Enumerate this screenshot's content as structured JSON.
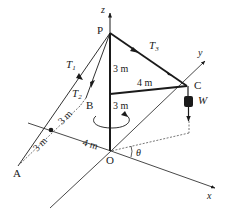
{
  "diagram": {
    "colors": {
      "line": "#1a1a1a",
      "axis": "#333333",
      "dashed": "#555555",
      "background": "#ffffff"
    },
    "axes": {
      "x": "x",
      "y": "y",
      "z": "z"
    },
    "points": {
      "P": "P",
      "A": "A",
      "B": "B",
      "C": "C",
      "O": "O"
    },
    "forces": {
      "T1": {
        "base": "T",
        "sub": "1"
      },
      "T2": {
        "base": "T",
        "sub": "2"
      },
      "T3": {
        "base": "T",
        "sub": "3"
      },
      "W": "W"
    },
    "dimensions": {
      "PtoArm": "3 m",
      "armToO": "3 m",
      "armLength": "4 m",
      "OtoDot": "4 m",
      "dotToB": "3 m",
      "dotToA": "3 m"
    },
    "angle": "θ"
  }
}
